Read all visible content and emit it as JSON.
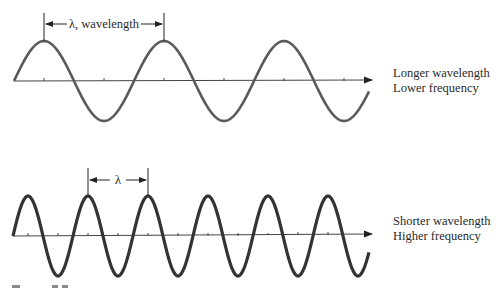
{
  "figure": {
    "top_panel": {
      "dimension_label": "λ, wavelength",
      "caption_line1": "Longer wavelength",
      "caption_line2": "Lower frequency",
      "wavelength_px": 120,
      "cycles": 3
    },
    "bottom_panel": {
      "dimension_label": "λ",
      "caption_line1": "Shorter wavelength",
      "caption_line2": "Higher frequency",
      "wavelength_px": 60,
      "cycles": 6
    },
    "colors": {
      "top_wave": "#5a5a5a",
      "bottom_wave": "#333333",
      "axis": "#444444",
      "text": "#2a2a2a"
    }
  }
}
